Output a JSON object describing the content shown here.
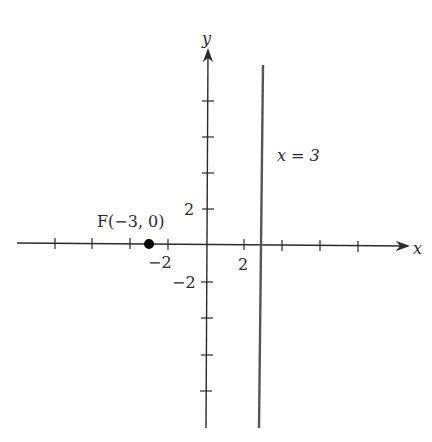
{
  "diagram": {
    "axes": {
      "x_label": "x",
      "y_label": "y",
      "x_tick_values": [
        -5,
        -4,
        -3,
        -2,
        1,
        2,
        3,
        4
      ],
      "y_tick_values": [
        8,
        6,
        4,
        2,
        -2,
        -4,
        -6,
        -8
      ],
      "x_tick_labels": {
        "neg": "−2",
        "pos": "2"
      },
      "y_tick_labels": {
        "pos": "2",
        "neg": "−2"
      }
    },
    "focus": {
      "label": "F(−3, 0)",
      "x": -3,
      "y": 0
    },
    "directrix": {
      "label": "x = 3",
      "x": 3
    },
    "colors": {
      "axis": "#2a2a2a",
      "line": "#555555",
      "point": "#000000"
    }
  }
}
